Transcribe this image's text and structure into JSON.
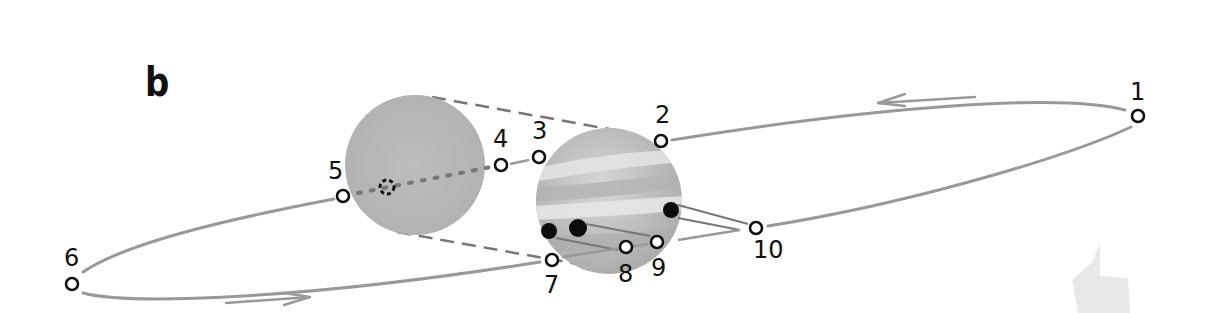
{
  "figure": {
    "panel_label": "b"
  },
  "positions": [
    {
      "id": 1,
      "label": "1",
      "x": 1138,
      "y": 116,
      "label_x": 1130,
      "label_y": 80
    },
    {
      "id": 2,
      "label": "2",
      "x": 661,
      "y": 141,
      "label_x": 655,
      "label_y": 104
    },
    {
      "id": 3,
      "label": "3",
      "x": 539,
      "y": 157,
      "label_x": 532,
      "label_y": 120
    },
    {
      "id": 4,
      "label": "4",
      "x": 501,
      "y": 165,
      "label_x": 494,
      "label_y": 128
    },
    {
      "id": 5,
      "label": "5",
      "x": 343,
      "y": 196,
      "label_x": 327,
      "label_y": 160
    },
    {
      "id": 6,
      "label": "6",
      "x": 72,
      "y": 284,
      "label_x": 64,
      "label_y": 246
    },
    {
      "id": 7,
      "label": "7",
      "x": 552,
      "y": 260,
      "label_x": 545,
      "label_y": 273
    },
    {
      "id": 8,
      "label": "8",
      "x": 626,
      "y": 247,
      "label_x": 619,
      "label_y": 262
    },
    {
      "id": 9,
      "label": "9",
      "x": 657,
      "y": 242,
      "label_x": 658,
      "label_y": 258
    },
    {
      "id": 10,
      "label": "10",
      "x": 756,
      "y": 228,
      "label_x": 756,
      "label_y": 240
    }
  ],
  "bodies": {
    "shadow_disk": {
      "name": "Jupiter shadow",
      "cx": 415,
      "cy": 165,
      "r": 70,
      "color": "#b9b9b9"
    },
    "planet": {
      "name": "Jupiter",
      "cx": 609,
      "cy": 201,
      "r": 73,
      "color": "#c4c4c4"
    },
    "eclipsed_moon": {
      "cx": 387,
      "cy": 187,
      "r": 7
    }
  },
  "shadow_spots": [
    {
      "cx": 549,
      "cy": 231,
      "r": 8
    },
    {
      "cx": 578,
      "cy": 228,
      "r": 9
    },
    {
      "cx": 671,
      "cy": 210,
      "r": 8
    }
  ],
  "arrows": [
    {
      "direction": "left",
      "x1": 975,
      "y1": 97,
      "x2": 880,
      "y2": 103
    },
    {
      "direction": "right",
      "x1": 226,
      "y1": 303,
      "x2": 310,
      "y2": 297
    }
  ],
  "colors": {
    "orbit": "#999999",
    "ink": "#111111",
    "shadow_dash": "#777777",
    "planet_band_light": "#e6e6e6",
    "planet_band_dark": "#a8a8a8",
    "shadow_spot": "#0d0d0d",
    "corner_mark": "#e8e8e8"
  }
}
